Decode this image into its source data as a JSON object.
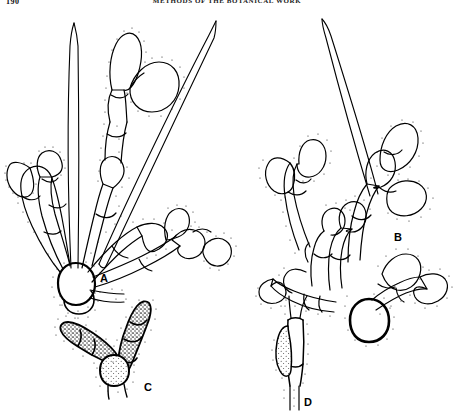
{
  "page": {
    "folio": "190",
    "running_head": "METHODS OF THE BOTANICAL WORK",
    "background_color": "#ffffff",
    "ink_color": "#000000",
    "medium": "pen-and-ink line drawing",
    "caption_font_style": "bold sans-serif capitals"
  },
  "figure_labels": [
    {
      "id": "A",
      "text": "A",
      "x": 104,
      "y": 280,
      "subject": "branched-cell-chain-with-setae"
    },
    {
      "id": "B",
      "text": "B",
      "x": 398,
      "y": 238,
      "subject": "dense-branched-cell-cluster"
    },
    {
      "id": "C",
      "text": "C",
      "x": 148,
      "y": 389,
      "subject": "granular-filled-cell-chain"
    },
    {
      "id": "D",
      "text": "D",
      "x": 308,
      "y": 404,
      "subject": "hypha-with-appressorium"
    }
  ],
  "figures": {
    "A": {
      "label": "A",
      "description": "Radiating branched chain of hyaline cells arising from a large rounded basal cell, with two long tapering setae",
      "basal_cell": {
        "cx": 75,
        "cy": 285,
        "rx": 17,
        "ry": 15,
        "wall": "thick"
      },
      "branch_count": 6,
      "terminal_cells": "ovoid to obovoid, dotted margin",
      "setae": [
        {
          "name": "erect-seta-left",
          "x1": 75,
          "y1": 270,
          "x2": 72,
          "y2": 22,
          "taper": "acute"
        },
        {
          "name": "oblique-seta-right",
          "x1": 100,
          "y1": 265,
          "x2": 216,
          "y2": 20,
          "taper": "acute"
        }
      ],
      "outline_style": "solid contour with stippled dotted border"
    },
    "B": {
      "label": "B",
      "description": "Compact dense cluster of swollen branched cells on a thick-walled rounded basal cell, with one long seta",
      "basal_cell": {
        "cx": 368,
        "cy": 320,
        "rx": 17,
        "ry": 15,
        "wall": "very thick"
      },
      "branch_count": 9,
      "terminal_cells": "clavate and ovoid, dotted margin",
      "setae": [
        {
          "name": "erect-seta",
          "x1": 372,
          "y1": 200,
          "x2": 322,
          "y2": 18,
          "taper": "acute"
        }
      ],
      "outline_style": "solid contour with stippled dotted border"
    },
    "C": {
      "label": "C",
      "description": "V-shaped two-armed chain of septate cells with dark granular (stippled) contents on a pale rounded basal cell",
      "basal_cell": {
        "cx": 112,
        "cy": 370,
        "rx": 13,
        "ry": 12,
        "fill": "fine stipple"
      },
      "arms": 2,
      "cells_per_arm": [
        3,
        4
      ],
      "cell_contents": "coarse dark granular stipple",
      "outline_style": "heavy solid contour with dotted margin"
    },
    "D": {
      "label": "D",
      "description": "Short length of hypha bearing a lateral lobed appressorium with granular contents",
      "hypha": {
        "x1": 296,
        "y1": 318,
        "x2": 296,
        "y2": 398,
        "width": 14
      },
      "appressorium": {
        "cx": 286,
        "cy": 358,
        "rx": 9,
        "ry": 20,
        "fill": "fine stipple"
      },
      "outline_style": "solid contour with dotted margin"
    }
  },
  "rendering": {
    "stipple_dot_radius": 0.55,
    "stipple_spacing_px": 3.2,
    "stroke_width_thin": 1,
    "stroke_width_thick": 2.2
  }
}
